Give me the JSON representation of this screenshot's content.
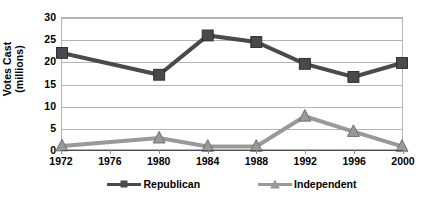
{
  "chart_data": {
    "type": "line",
    "title": "",
    "xlabel": "",
    "ylabel": "Votes Cast (millions)",
    "ylabel_lines": [
      "Votes Cast",
      "(millions)"
    ],
    "categories": [
      "1972",
      "1976",
      "1980",
      "1984",
      "1988",
      "1992",
      "1996",
      "2000"
    ],
    "x_tick_labels": [
      "1972",
      "1976",
      "1980",
      "1984",
      "1988",
      "1992",
      "1996",
      "2000"
    ],
    "y_tick_labels": [
      "30",
      "25",
      "20",
      "15",
      "10",
      "5",
      "0"
    ],
    "y_tick_values": [
      30,
      25,
      20,
      15,
      10,
      5,
      0
    ],
    "ylim": [
      0,
      30
    ],
    "grid": true,
    "grid_axis": "y",
    "legend_position": "bottom",
    "series": [
      {
        "name": "Republican",
        "marker": "square",
        "color": "#4a4a4a",
        "x": [
          "1972",
          "1980",
          "1984",
          "1988",
          "1992",
          "1996",
          "2000"
        ],
        "values": [
          22,
          17,
          26,
          24.5,
          19.5,
          16.5,
          19.7
        ]
      },
      {
        "name": "Independent",
        "marker": "triangle",
        "color": "#999999",
        "x": [
          "1972",
          "1980",
          "1984",
          "1988",
          "1992",
          "1996",
          "2000"
        ],
        "values": [
          0.7,
          2.5,
          0.6,
          0.6,
          7.5,
          4.0,
          0.6
        ]
      }
    ]
  },
  "legend": {
    "items": [
      {
        "label": "Republican",
        "color": "#4a4a4a",
        "marker": "square"
      },
      {
        "label": "Independent",
        "color": "#999999",
        "marker": "triangle"
      }
    ]
  },
  "colors": {
    "republican": "#4a4a4a",
    "independent": "#999999",
    "gridline": "#b4b4b4",
    "axis": "#4d4d4d",
    "background": "#ffffff",
    "text": "#000000"
  }
}
